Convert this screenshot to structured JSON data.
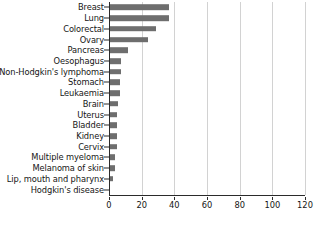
{
  "chart_data": {
    "type": "bar",
    "orientation": "horizontal",
    "title": "",
    "subtitle": "",
    "xlabel": "",
    "ylabel": "",
    "xlim": [
      0,
      120
    ],
    "xticks": [
      0,
      20,
      40,
      60,
      80,
      100,
      120
    ],
    "grid": true,
    "grid_axis": "x",
    "legend": false,
    "bar_color": "#6e6e6e",
    "axis_color": "#2b2b2b",
    "grid_color": "#d2d2d2",
    "text_color": "#161616",
    "background": "#ffffff",
    "categories": [
      "Breast",
      "Lung",
      "Colorectal",
      "Ovary",
      "Pancreas",
      "Oesophagus",
      "Non-Hodgkin's lymphoma",
      "Stomach",
      "Leukaemia",
      "Brain",
      "Uterus",
      "Bladder",
      "Kidney",
      "Cervix",
      "Multiple myeloma",
      "Melanoma of skin",
      "Lip, mouth and pharynx",
      "Hodgkin's disease"
    ],
    "values": [
      36,
      36,
      28,
      23,
      11,
      7,
      7,
      6,
      6,
      5,
      4,
      4,
      4,
      4,
      3,
      3,
      2,
      0
    ]
  }
}
